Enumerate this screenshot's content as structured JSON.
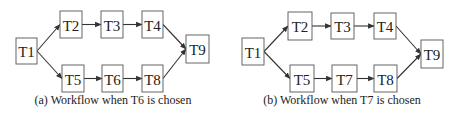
{
  "diagrams": [
    {
      "caption": "(a) Workflow when T6 is chosen",
      "nodes": [
        {
          "id": "T1",
          "label": "T1",
          "x": 16,
          "y": 38,
          "w": 21,
          "h": 26
        },
        {
          "id": "T2",
          "label": "T2",
          "x": 60,
          "y": 11,
          "w": 22,
          "h": 27
        },
        {
          "id": "T3",
          "label": "T3",
          "x": 101,
          "y": 11,
          "w": 22,
          "h": 27
        },
        {
          "id": "T4",
          "label": "T4",
          "x": 142,
          "y": 11,
          "w": 21,
          "h": 27
        },
        {
          "id": "T5",
          "label": "T5",
          "x": 62,
          "y": 65,
          "w": 22,
          "h": 27
        },
        {
          "id": "T6",
          "label": "T6",
          "x": 102,
          "y": 65,
          "w": 21,
          "h": 27
        },
        {
          "id": "T8",
          "label": "T8",
          "x": 142,
          "y": 65,
          "w": 21,
          "h": 27
        },
        {
          "id": "T9",
          "label": "T9",
          "x": 186,
          "y": 35,
          "w": 23,
          "h": 28
        }
      ],
      "edges": [
        [
          "T1",
          "T2"
        ],
        [
          "T2",
          "T3"
        ],
        [
          "T3",
          "T4"
        ],
        [
          "T4",
          "T9"
        ],
        [
          "T1",
          "T5"
        ],
        [
          "T5",
          "T6"
        ],
        [
          "T6",
          "T8"
        ],
        [
          "T8",
          "T9"
        ]
      ]
    },
    {
      "caption": "(b) Workflow when T7 is chosen",
      "nodes": [
        {
          "id": "T1",
          "label": "T1",
          "x": 242,
          "y": 38,
          "w": 22,
          "h": 27
        },
        {
          "id": "T2",
          "label": "T2",
          "x": 288,
          "y": 12,
          "w": 24,
          "h": 28
        },
        {
          "id": "T3",
          "label": "T3",
          "x": 331,
          "y": 13,
          "w": 23,
          "h": 26
        },
        {
          "id": "T4",
          "label": "T4",
          "x": 374,
          "y": 13,
          "w": 22,
          "h": 26
        },
        {
          "id": "T5",
          "label": "T5",
          "x": 290,
          "y": 65,
          "w": 24,
          "h": 27
        },
        {
          "id": "T7",
          "label": "T7",
          "x": 332,
          "y": 65,
          "w": 25,
          "h": 27
        },
        {
          "id": "T8",
          "label": "T8",
          "x": 374,
          "y": 65,
          "w": 23,
          "h": 27
        },
        {
          "id": "T9",
          "label": "T9",
          "x": 421,
          "y": 40,
          "w": 22,
          "h": 28
        }
      ],
      "edges": [
        [
          "T1",
          "T2"
        ],
        [
          "T2",
          "T3"
        ],
        [
          "T3",
          "T4"
        ],
        [
          "T4",
          "T9"
        ],
        [
          "T1",
          "T5"
        ],
        [
          "T5",
          "T7"
        ],
        [
          "T7",
          "T8"
        ],
        [
          "T8",
          "T9"
        ]
      ]
    }
  ],
  "captions": {
    "a": "(a) Workflow when T6 is chosen",
    "b": "(b) Workflow when T7 is chosen"
  },
  "colors": {
    "box_stroke": "#555555",
    "edge": "#333333",
    "text": "#222222"
  }
}
